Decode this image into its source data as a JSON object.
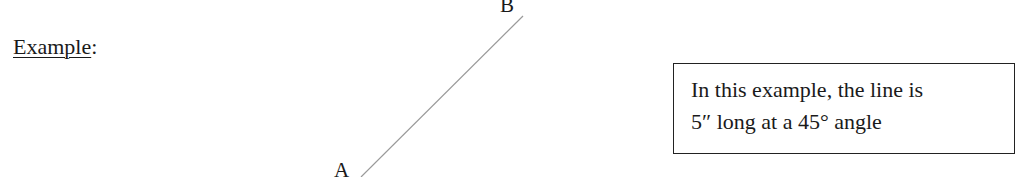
{
  "heading": {
    "label": "Example",
    "suffix": ":"
  },
  "figure": {
    "line": {
      "start_label": "A",
      "end_label": "B",
      "color": "#9a9a9a",
      "x1": 361,
      "y1": 177,
      "x2": 523,
      "y2": 16
    }
  },
  "note": {
    "line1": "In this example, the line is",
    "line2": "5″ long at a 45° angle"
  }
}
